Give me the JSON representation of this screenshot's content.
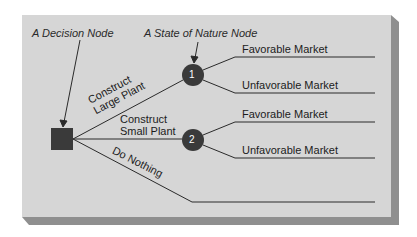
{
  "diagram": {
    "type": "decision-tree",
    "annotations": {
      "decision_node": "A Decision Node",
      "state_of_nature_node": "A State of Nature Node"
    },
    "decision_branches": [
      {
        "label_line1": "Construct",
        "label_line2": "Large Plant",
        "node": "1"
      },
      {
        "label_line1": "Construct",
        "label_line2": "Small Plant",
        "node": "2"
      },
      {
        "label_line1": "Do Nothing"
      }
    ],
    "outcomes": {
      "node1": [
        "Favorable Market",
        "Unfavorable Market"
      ],
      "node2": [
        "Favorable Market",
        "Unfavorable Market"
      ]
    },
    "colors": {
      "panel": "#d4d4d4",
      "panel_shadow": "#8f8f8f",
      "node_fill": "#3a3a3a",
      "line": "#2a2a2a"
    }
  }
}
